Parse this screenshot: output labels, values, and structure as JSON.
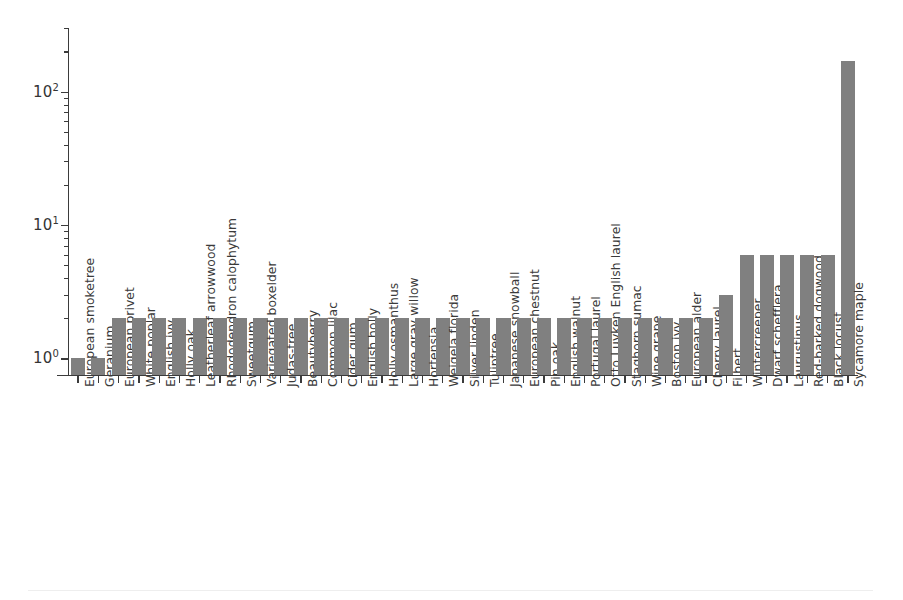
{
  "chart_data": {
    "type": "bar",
    "title": "",
    "subtitle": "",
    "xlabel": "",
    "ylabel": "",
    "yscale": "log",
    "ylim": [
      0.75,
      300
    ],
    "grid": false,
    "legend": null,
    "bar_color": "#808080",
    "axis_color": "#3b3b3b",
    "y_ticks": [
      {
        "value": 1,
        "label": "10",
        "exponent": "0"
      },
      {
        "value": 10,
        "label": "10",
        "exponent": "1"
      },
      {
        "value": 100,
        "label": "10",
        "exponent": "2"
      }
    ],
    "categories": [
      "European smoketree",
      "Geranium",
      "European privet",
      "White poplar",
      "English ivy",
      "Holly oak",
      "Leatherleaf arrowwood",
      "Rhododendron calophytum",
      "Sweetgum",
      "Variegated boxelder",
      "Judas-tree",
      "Beautyberry",
      "Common lilac",
      "Cider gum",
      "English holly",
      "Holly osmanthus",
      "Large gray willow",
      "Hortensia",
      "Weigela florida",
      "Silver linden",
      "Tuliptree",
      "Japanese snowball",
      "European chestnut",
      "Pin oak",
      "English walnut",
      "Portugal laurel",
      "Otto Luyken English laurel",
      "Staghorn sumac",
      "Wine grape",
      "Boston ivy",
      "European alder",
      "Cherry laurel",
      "Filbert",
      "Wintercreeper",
      "Dwarf schefflera",
      "Laurustinus",
      "Red-barked dogwood",
      "Black locust",
      "Sycamore maple"
    ],
    "values": [
      1,
      1,
      2,
      2,
      2,
      2,
      2,
      2,
      2,
      2,
      2,
      2,
      2,
      2,
      2,
      2,
      2,
      2,
      2,
      2,
      2,
      2,
      2,
      2,
      2,
      2,
      2,
      2,
      2,
      2,
      2,
      2,
      3,
      6,
      6,
      6,
      6,
      6,
      170
    ]
  }
}
